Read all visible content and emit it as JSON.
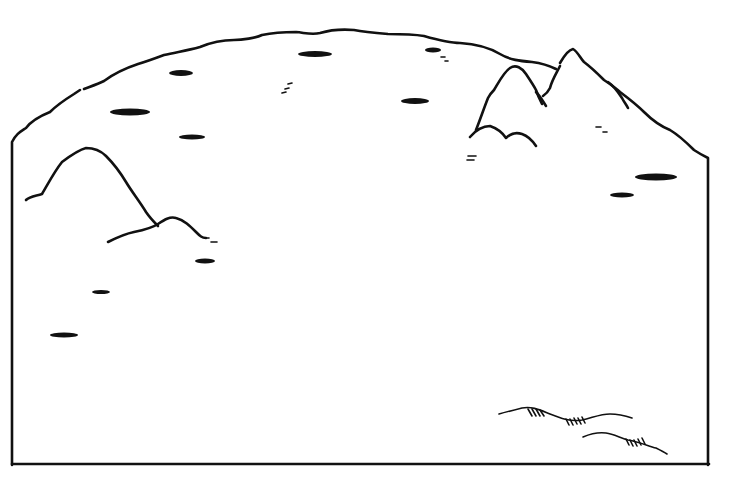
{
  "drawing": {
    "type": "line-drawing",
    "subject": "landscape scene outline with hills and scattered marks",
    "colors": {
      "ink": "#111111",
      "paper": "#ffffff"
    },
    "blobs": [
      {
        "cx": 181,
        "cy": 73,
        "rx": 12,
        "ry": 3
      },
      {
        "cx": 315,
        "cy": 54,
        "rx": 17,
        "ry": 3
      },
      {
        "cx": 433,
        "cy": 50,
        "rx": 8,
        "ry": 2.5
      },
      {
        "cx": 130,
        "cy": 112,
        "rx": 20,
        "ry": 3.5
      },
      {
        "cx": 415,
        "cy": 101,
        "rx": 14,
        "ry": 3
      },
      {
        "cx": 192,
        "cy": 137,
        "rx": 13,
        "ry": 2.5
      },
      {
        "cx": 656,
        "cy": 177,
        "rx": 21,
        "ry": 3.5
      },
      {
        "cx": 622,
        "cy": 195,
        "rx": 12,
        "ry": 2.5
      },
      {
        "cx": 205,
        "cy": 261,
        "rx": 10,
        "ry": 2.5
      },
      {
        "cx": 101,
        "cy": 292,
        "rx": 9,
        "ry": 2
      },
      {
        "cx": 64,
        "cy": 335,
        "rx": 14,
        "ry": 2.5
      }
    ],
    "dashes": [
      {
        "x1": 288,
        "y1": 84,
        "x2": 292,
        "y2": 83
      },
      {
        "x1": 282,
        "y1": 93,
        "x2": 286,
        "y2": 92
      },
      {
        "x1": 285,
        "y1": 89,
        "x2": 289,
        "y2": 88
      },
      {
        "x1": 441,
        "y1": 57,
        "x2": 445,
        "y2": 57
      },
      {
        "x1": 445,
        "y1": 61,
        "x2": 448,
        "y2": 61
      },
      {
        "x1": 596,
        "y1": 127,
        "x2": 601,
        "y2": 127
      },
      {
        "x1": 603,
        "y1": 132,
        "x2": 607,
        "y2": 132
      },
      {
        "x1": 468,
        "y1": 156,
        "x2": 476,
        "y2": 156
      },
      {
        "x1": 467,
        "y1": 160,
        "x2": 474,
        "y2": 160
      },
      {
        "x1": 205,
        "y1": 238,
        "x2": 209,
        "y2": 238
      },
      {
        "x1": 211,
        "y1": 242,
        "x2": 217,
        "y2": 242
      }
    ]
  }
}
